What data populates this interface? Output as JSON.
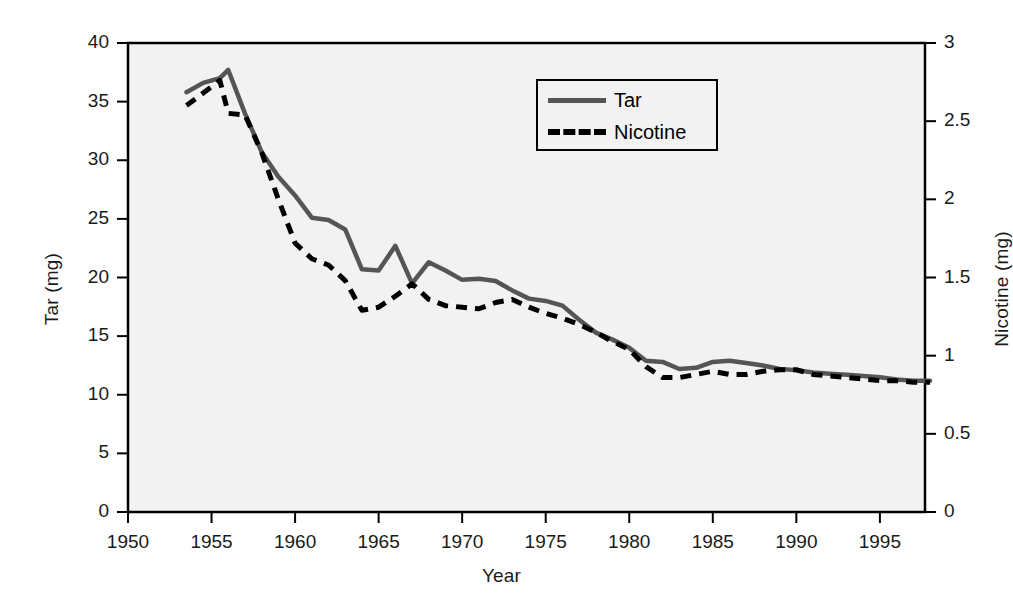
{
  "chart_data": {
    "type": "line",
    "title": "",
    "xlabel": "Year",
    "ylabel": "Tar (mg)",
    "y2label": "Nicotine (mg)",
    "xlim": [
      1950,
      1997.7
    ],
    "ylim": [
      0,
      40
    ],
    "y2lim": [
      0,
      3
    ],
    "grid": false,
    "legend_position": "top-center",
    "x_ticks": [
      1950,
      1955,
      1960,
      1965,
      1970,
      1975,
      1980,
      1985,
      1990,
      1995
    ],
    "x_tick_labels": [
      "1950",
      "1955",
      "1960",
      "1965",
      "1970",
      "1975",
      "1980",
      "1985",
      "1990",
      "1995"
    ],
    "y_ticks": [
      0,
      5,
      10,
      15,
      20,
      25,
      30,
      35,
      40
    ],
    "y_tick_labels": [
      "0",
      "5",
      "10",
      "15",
      "20",
      "25",
      "30",
      "35",
      "40"
    ],
    "y2_ticks": [
      0,
      0.5,
      1,
      1.5,
      2,
      2.5,
      3
    ],
    "y2_tick_labels": [
      "0",
      "0.5",
      "1",
      "1.5",
      "2",
      "2.5",
      "3"
    ],
    "x": [
      1953.5,
      1954.5,
      1955.5,
      1956,
      1957,
      1958,
      1959,
      1960,
      1961,
      1962,
      1963,
      1964,
      1965,
      1966,
      1967,
      1968,
      1969,
      1970,
      1971,
      1972,
      1973,
      1974,
      1975,
      1976,
      1977,
      1978,
      1979,
      1980,
      1981,
      1982,
      1983,
      1984,
      1985,
      1986,
      1987,
      1988,
      1989,
      1990,
      1991,
      1992,
      1993,
      1994,
      1995,
      1996,
      1997,
      1998
    ],
    "series": [
      {
        "name": "Tar",
        "axis": "left",
        "units": "mg",
        "color": "#555555",
        "style": "solid",
        "values": [
          35.8,
          36.6,
          37.0,
          37.7,
          34.0,
          30.7,
          28.6,
          27.0,
          25.1,
          24.9,
          24.1,
          20.7,
          20.6,
          22.7,
          19.5,
          21.3,
          20.6,
          19.8,
          19.9,
          19.7,
          18.9,
          18.2,
          18.0,
          17.6,
          16.4,
          15.3,
          14.7,
          14.0,
          12.9,
          12.8,
          12.2,
          12.3,
          12.8,
          12.9,
          12.7,
          12.5,
          12.2,
          12.1,
          11.9,
          11.8,
          11.7,
          11.6,
          11.5,
          11.3,
          11.2,
          11.2
        ]
      },
      {
        "name": "Nicotine",
        "axis": "right",
        "units": "mg",
        "color": "#000000",
        "style": "dashed",
        "values": [
          2.6,
          2.68,
          2.76,
          2.55,
          2.54,
          2.3,
          2.0,
          1.72,
          1.62,
          1.58,
          1.48,
          1.29,
          1.31,
          1.38,
          1.46,
          1.36,
          1.32,
          1.31,
          1.3,
          1.34,
          1.36,
          1.31,
          1.27,
          1.24,
          1.2,
          1.15,
          1.09,
          1.04,
          0.93,
          0.86,
          0.86,
          0.88,
          0.9,
          0.88,
          0.88,
          0.9,
          0.91,
          0.91,
          0.88,
          0.87,
          0.86,
          0.85,
          0.84,
          0.84,
          0.83,
          0.83
        ]
      }
    ]
  },
  "legend": {
    "items": [
      {
        "label": "Tar",
        "style": "solid",
        "color": "#555555"
      },
      {
        "label": "Nicotine",
        "style": "dashed",
        "color": "#000000"
      }
    ]
  },
  "axes": {
    "x_title": "Year",
    "y_left_title": "Tar (mg)",
    "y_right_title": "Nicotine (mg)"
  },
  "colors": {
    "tar_line": "#555555",
    "nicotine_line": "#000000",
    "plot_background": "#f2f2f2",
    "axis": "#000000"
  }
}
